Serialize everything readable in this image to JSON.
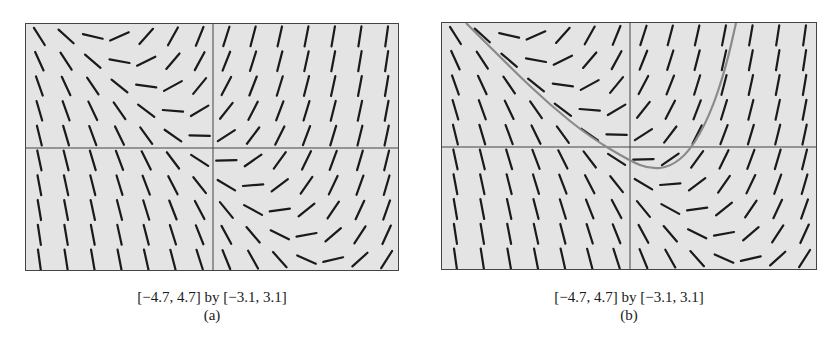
{
  "panels": [
    {
      "id": "a",
      "window_label": "[−4.7, 4.7] by [−3.1, 3.1]",
      "sub_label": "(a)",
      "show_solution_curve": false
    },
    {
      "id": "b",
      "window_label": "[−4.7, 4.7] by [−3.1, 3.1]",
      "sub_label": "(b)",
      "show_solution_curve": true
    }
  ],
  "colors": {
    "plot_background": "#e4e4e4",
    "segment": "#1a1a1a",
    "axis": "#444444",
    "solution_curve": "#8a8a8a"
  },
  "chart_data": [
    {
      "type": "slope_field",
      "title": "(a)",
      "xlabel": "[−4.7, 4.7] by [−3.1, 3.1]",
      "xlim": [
        -4.7,
        4.7
      ],
      "ylim": [
        -3.1,
        3.1
      ],
      "grid": false,
      "axes": true,
      "columns": 14,
      "rows": 10,
      "differential_equation": "dy/dx = x + y (estimated from field)"
    },
    {
      "type": "slope_field",
      "title": "(b)",
      "xlabel": "[−4.7, 4.7] by [−3.1, 3.1]",
      "xlim": [
        -4.7,
        4.7
      ],
      "ylim": [
        -3.1,
        3.1
      ],
      "grid": false,
      "axes": true,
      "columns": 14,
      "rows": 10,
      "differential_equation": "dy/dx = x + y (estimated from field)",
      "solution_curve": {
        "description": "particular solution drawn over the slope field",
        "points": [
          [
            -4.1,
            3.1
          ],
          [
            -3.0,
            2.0
          ],
          [
            -2.0,
            1.05
          ],
          [
            -1.0,
            0.25
          ],
          [
            0.0,
            -0.35
          ],
          [
            0.5,
            -0.55
          ],
          [
            1.0,
            -0.5
          ],
          [
            1.5,
            -0.1
          ],
          [
            2.0,
            0.8
          ],
          [
            2.4,
            2.0
          ],
          [
            2.65,
            3.1
          ]
        ]
      }
    }
  ]
}
